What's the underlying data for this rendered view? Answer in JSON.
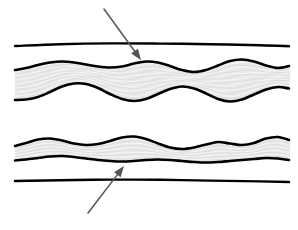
{
  "figure": {
    "background_color": "#ffffff",
    "width": 298,
    "height": 230,
    "colors": {
      "outline": "#000000",
      "layer_fill": "#e9e9e9",
      "striation_light": "#ffffff",
      "striation_dark": "#d2d2d2",
      "annotation": "#555555"
    },
    "panels": [
      {
        "id": "upper-panel",
        "label": "Upper cross-section",
        "datum_line": {
          "label": "straight reference horizon",
          "orientation": "horizontal",
          "position": "above layer",
          "stroke_width": 2.4
        },
        "layer": {
          "label": "thick folded layer",
          "fill": "#e9e9e9",
          "outline_width": 2.6,
          "texture": "laminated striations",
          "fold_amplitude": "large",
          "fold_wavelength": "short",
          "thickness": "thick"
        },
        "annotation": {
          "type": "arrow",
          "direction": "down-right",
          "points_to": "upper contact of folded layer",
          "from": [
            104,
            9
          ],
          "to": [
            141,
            60
          ]
        }
      },
      {
        "id": "lower-panel",
        "label": "Lower cross-section",
        "datum_line": {
          "label": "straight reference horizon",
          "orientation": "horizontal",
          "position": "below layer",
          "stroke_width": 2.4
        },
        "layer": {
          "label": "thin gently folded layer",
          "fill": "#e9e9e9",
          "outline_width": 2.6,
          "texture": "laminated striations",
          "fold_amplitude": "small",
          "fold_wavelength": "irregular",
          "thickness": "thin"
        },
        "annotation": {
          "type": "arrow",
          "direction": "up-right",
          "points_to": "lower contact of folded layer",
          "from": [
            88,
            213
          ],
          "to": [
            124,
            166
          ]
        }
      }
    ]
  },
  "chart_data": {
    "type": "line",
    "xlabel": "",
    "ylabel": "",
    "xlim": [
      0,
      298
    ],
    "ylim": [
      230,
      0
    ],
    "grid": false,
    "legend": "none",
    "series": [
      {
        "name": "upper-datum-line",
        "panel": "upper-panel",
        "role": "straight reference horizon",
        "x": [
          15,
          60,
          110,
          160,
          210,
          260,
          289
        ],
        "y": [
          46,
          44.2,
          43.4,
          43.6,
          44.2,
          45.2,
          46.2
        ]
      },
      {
        "name": "upper-layer-top-contact",
        "panel": "upper-panel",
        "role": "top boundary of thick folded layer",
        "x": [
          15,
          26,
          38,
          50,
          62,
          74,
          86,
          98,
          110,
          122,
          134,
          146,
          158,
          170,
          182,
          194,
          206,
          218,
          230,
          242,
          254,
          266,
          278,
          289
        ],
        "y": [
          70,
          68,
          65,
          62.5,
          61.5,
          62.5,
          64.5,
          66.5,
          67.5,
          66.5,
          63.5,
          61.5,
          62.5,
          66,
          70,
          72,
          70,
          65.5,
          61,
          59.5,
          61.5,
          65.5,
          68,
          66
        ]
      },
      {
        "name": "upper-layer-bottom-contact",
        "panel": "upper-panel",
        "role": "bottom boundary of thick folded layer",
        "x": [
          15,
          26,
          38,
          50,
          62,
          74,
          86,
          98,
          110,
          122,
          134,
          146,
          158,
          170,
          182,
          194,
          206,
          218,
          230,
          242,
          254,
          266,
          278,
          289
        ],
        "y": [
          100,
          99.5,
          97,
          92,
          86.5,
          83.5,
          84,
          88,
          94,
          99,
          101,
          99,
          94,
          89,
          86.5,
          88.5,
          93.5,
          99,
          101.5,
          99.5,
          94.5,
          89.5,
          87,
          88.5
        ]
      },
      {
        "name": "lower-layer-top-contact",
        "panel": "lower-panel",
        "role": "top boundary of thin folded layer",
        "x": [
          15,
          26,
          38,
          50,
          62,
          74,
          86,
          98,
          110,
          122,
          134,
          146,
          158,
          170,
          182,
          194,
          206,
          218,
          230,
          242,
          254,
          266,
          278,
          289
        ],
        "y": [
          146,
          143,
          139.5,
          138.5,
          140.5,
          143.5,
          145,
          144,
          141,
          137.5,
          136.5,
          139,
          143.5,
          147.5,
          149,
          147.5,
          144.5,
          142,
          143.5,
          145,
          143,
          138.5,
          137,
          140
        ]
      },
      {
        "name": "lower-layer-bottom-contact",
        "panel": "lower-panel",
        "role": "bottom boundary of thin folded layer",
        "x": [
          15,
          26,
          38,
          50,
          62,
          74,
          86,
          98,
          110,
          122,
          134,
          146,
          158,
          170,
          182,
          194,
          206,
          218,
          230,
          242,
          254,
          266,
          278,
          289
        ],
        "y": [
          160.5,
          159.5,
          158,
          156.5,
          156,
          157,
          158.5,
          160,
          161,
          161.5,
          161,
          160,
          159.5,
          160,
          161,
          162,
          162.5,
          162,
          161,
          160,
          159,
          158,
          158.5,
          160
        ]
      },
      {
        "name": "lower-datum-line",
        "panel": "lower-panel",
        "role": "straight reference horizon",
        "x": [
          15,
          60,
          110,
          160,
          210,
          260,
          289
        ],
        "y": [
          181,
          180.2,
          179.6,
          179.8,
          180.6,
          181.4,
          182
        ]
      }
    ],
    "annotations": [
      {
        "name": "upper-arrow",
        "type": "arrow",
        "from": [
          104,
          9
        ],
        "to": [
          141,
          60
        ],
        "color": "#555555",
        "points_to": "upper contact of folded layer"
      },
      {
        "name": "lower-arrow",
        "type": "arrow",
        "from": [
          88,
          213
        ],
        "to": [
          124,
          166
        ],
        "color": "#555555",
        "points_to": "lower contact of folded layer"
      }
    ]
  }
}
